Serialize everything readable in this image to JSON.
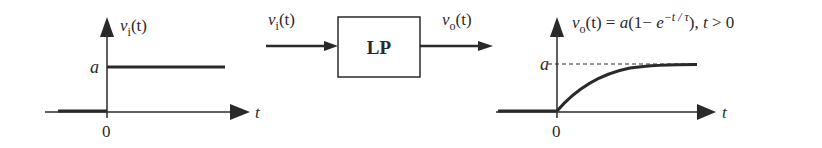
{
  "input_plot": {
    "ylabel_var": "v",
    "ylabel_sub": "i",
    "ylabel_arg": "(t)",
    "level_label": "a",
    "origin_label": "0",
    "xlabel": "t"
  },
  "block": {
    "label": "LP",
    "input_var": "v",
    "input_sub": "i",
    "input_arg": "(t)",
    "output_var": "v",
    "output_sub": "o",
    "output_arg": "(t)"
  },
  "output_plot": {
    "formula_var": "v",
    "formula_sub": "o",
    "formula_lhs_arg": "(t) = ",
    "formula_a": "a",
    "formula_paren": "(1− ",
    "formula_e": "e",
    "formula_exp": "−t / τ",
    "formula_tail": "), ",
    "formula_cond_t": "t",
    "formula_cond": " > 0",
    "level_label": "a",
    "origin_label": "0",
    "xlabel": "t"
  },
  "colors": {
    "ink": "#2a2a2a",
    "background": "#ffffff"
  }
}
